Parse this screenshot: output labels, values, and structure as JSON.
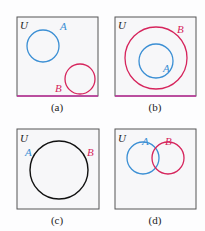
{
  "colors": {
    "set_a": "#3b8fd4",
    "set_b": "#d6245c",
    "equal_set": "#111111",
    "frame": "#555555",
    "universe_label": "#222222",
    "panel_fill": "#f7f7f9",
    "accent_edge": "#c0309c"
  },
  "universe_label": "U",
  "panels": [
    {
      "id": "a",
      "caption": "(a)",
      "description": "A and B disjoint",
      "label_a": "A",
      "label_b": "B"
    },
    {
      "id": "b",
      "caption": "(b)",
      "description": "A is a subset of B",
      "label_a": "A",
      "label_b": "B"
    },
    {
      "id": "c",
      "caption": "(c)",
      "description": "A equals B",
      "label_a": "A",
      "label_b": "B"
    },
    {
      "id": "d",
      "caption": "(d)",
      "description": "A and B overlap",
      "label_a": "A",
      "label_b": "B"
    }
  ]
}
